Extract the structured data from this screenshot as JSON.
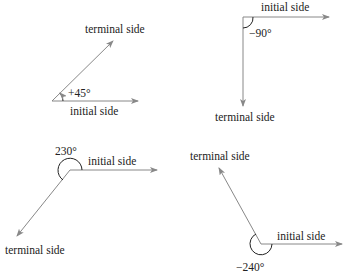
{
  "diagrams": [
    {
      "id": "angle-positive-45",
      "angle_label": "+45°",
      "initial_label": "initial side",
      "terminal_label": "terminal side"
    },
    {
      "id": "angle-negative-90",
      "angle_label": "−90°",
      "initial_label": "initial side",
      "terminal_label": "terminal side"
    },
    {
      "id": "angle-positive-230",
      "angle_label": "230°",
      "initial_label": "initial side",
      "terminal_label": "terminal side"
    },
    {
      "id": "angle-negative-240",
      "angle_label": "−240°",
      "initial_label": "initial side",
      "terminal_label": "terminal side"
    }
  ],
  "colors": {
    "ray": "#888888",
    "arc": "#222222",
    "text": "#222222"
  }
}
